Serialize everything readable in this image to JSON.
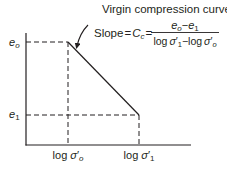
{
  "diagram": {
    "type": "soil-consolidation-e-log-sigma",
    "colors": {
      "line": "#231f20",
      "background": "#ffffff"
    },
    "annotation": {
      "title": "Virgin compression curve",
      "slope_label": "Slope",
      "equals": "=",
      "cc_symbol": "C",
      "cc_sub": "c",
      "numerator": {
        "a": "e",
        "a_sub": "o",
        "minus": "−",
        "b": "e",
        "b_sub": "1"
      },
      "denominator": {
        "log1": "log",
        "sigma1": "σ",
        "prime1": "′",
        "sub1": "1",
        "minus": "−",
        "log0": "log",
        "sigma0": "σ",
        "prime0": "′",
        "sub0": "o"
      }
    },
    "y_labels": [
      {
        "symbol": "e",
        "sub": "o"
      },
      {
        "symbol": "e",
        "sub": "1"
      }
    ],
    "x_labels": [
      {
        "log": "log",
        "symbol": "σ",
        "prime": "′",
        "sub": "o"
      },
      {
        "log": "log",
        "symbol": "σ",
        "prime": "′",
        "sub": "1"
      }
    ],
    "points": [
      {
        "name": "start",
        "x_label": "log σ'o",
        "y_label": "eo"
      },
      {
        "name": "end",
        "x_label": "log σ'1",
        "y_label": "e1"
      }
    ]
  }
}
